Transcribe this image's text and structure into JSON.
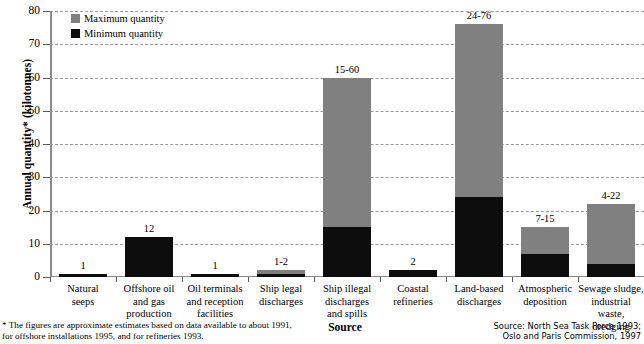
{
  "chart_data": {
    "type": "bar",
    "title": "",
    "subtype": "stacked-range",
    "xlabel": "Source",
    "ylabel": "Annual quantity* (kilotonnes)",
    "ylim": [
      0,
      80
    ],
    "yticks": [
      0,
      10,
      20,
      30,
      40,
      50,
      60,
      70,
      80
    ],
    "grid": true,
    "legend_position": "top-left",
    "categories": [
      "Natural seeps",
      "Offshore oil and gas production",
      "Oil terminals and reception facilities",
      "Ship legal discharges",
      "Ship illegal discharges and spills",
      "Coastal refineries",
      "Land-based discharges",
      "Atmospheric deposition",
      "Sewage sludge, industrial waste, dredging"
    ],
    "category_lines": [
      [
        "Natural",
        "seeps"
      ],
      [
        "Offshore oil",
        "and gas",
        "production"
      ],
      [
        "Oil terminals",
        "and reception",
        "facilities"
      ],
      [
        "Ship legal",
        "discharges"
      ],
      [
        "Ship illegal",
        "discharges",
        "and spills"
      ],
      [
        "Coastal",
        "refineries"
      ],
      [
        "Land-based",
        "discharges"
      ],
      [
        "Atmospheric",
        "deposition"
      ],
      [
        "Sewage sludge,",
        "industrial waste,",
        "dredging"
      ]
    ],
    "series": [
      {
        "name": "Minimum quantity",
        "color": "#0d0d0d",
        "values": [
          1,
          12,
          1,
          1,
          15,
          2,
          24,
          7,
          4
        ]
      },
      {
        "name": "Maximum quantity",
        "color": "#808080",
        "values": [
          1,
          12,
          1,
          2,
          60,
          2,
          76,
          15,
          22
        ]
      }
    ],
    "data_labels": [
      "1",
      "12",
      "1",
      "1-2",
      "15-60",
      "2",
      "24-76",
      "7-15",
      "4-22"
    ],
    "tick_labels": [
      "0",
      "10",
      "20",
      "30",
      "40",
      "50",
      "60",
      "70",
      "80"
    ]
  },
  "legend": {
    "items": [
      {
        "label": "Maximum quantity",
        "color": "#808080"
      },
      {
        "label": "Minimum quantity",
        "color": "#0d0d0d"
      }
    ]
  },
  "footnote": {
    "line1": "* The figures are approximate estimates based on data available to about 1991,",
    "line2": "for offshore installations 1995, and for refineries 1993."
  },
  "source": {
    "line1": "Source: North Sea Task Force 1993;",
    "line2": "Oslo and Paris Commission, 1997"
  }
}
